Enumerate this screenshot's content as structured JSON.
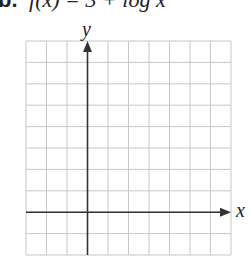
{
  "problem": {
    "label": "b.",
    "function_text": "f(x) = 3 + log x"
  },
  "graph": {
    "x_axis_label": "x",
    "y_axis_label": "y",
    "grid": {
      "columns": 10,
      "rows": 10,
      "left": 26,
      "top": 41,
      "right": 231,
      "bottom": 255,
      "line_color": "#c8c8c8"
    },
    "axes": {
      "color": "#333333",
      "y_axis_column_index": 3,
      "x_axis_row_index": 8
    }
  }
}
